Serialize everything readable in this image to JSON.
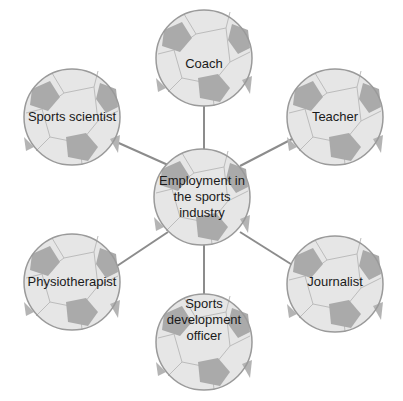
{
  "diagram": {
    "type": "spider-diagram",
    "center": {
      "label": "Employment in the sports industry",
      "lines": [
        "Employment in",
        "the sports",
        "industry"
      ]
    },
    "nodes": [
      {
        "id": "coach",
        "label": "Coach"
      },
      {
        "id": "sports-scientist",
        "label": "Sports scientist"
      },
      {
        "id": "teacher",
        "label": "Teacher"
      },
      {
        "id": "physiotherapist",
        "label": "Physiotherapist"
      },
      {
        "id": "journalist",
        "label": "Journalist"
      },
      {
        "id": "sports-development-officer",
        "label": "Sports development officer",
        "lines": [
          "Sports",
          "development",
          "officer"
        ]
      }
    ],
    "colors": {
      "ball_fill": "#e6e6e6",
      "ball_panel_dark": "#aaaaaa",
      "ball_seam": "#bcbcbc",
      "ball_outline": "#9a9a9a",
      "connector": "#8c8c8c",
      "text": "#1a1a1a"
    }
  }
}
